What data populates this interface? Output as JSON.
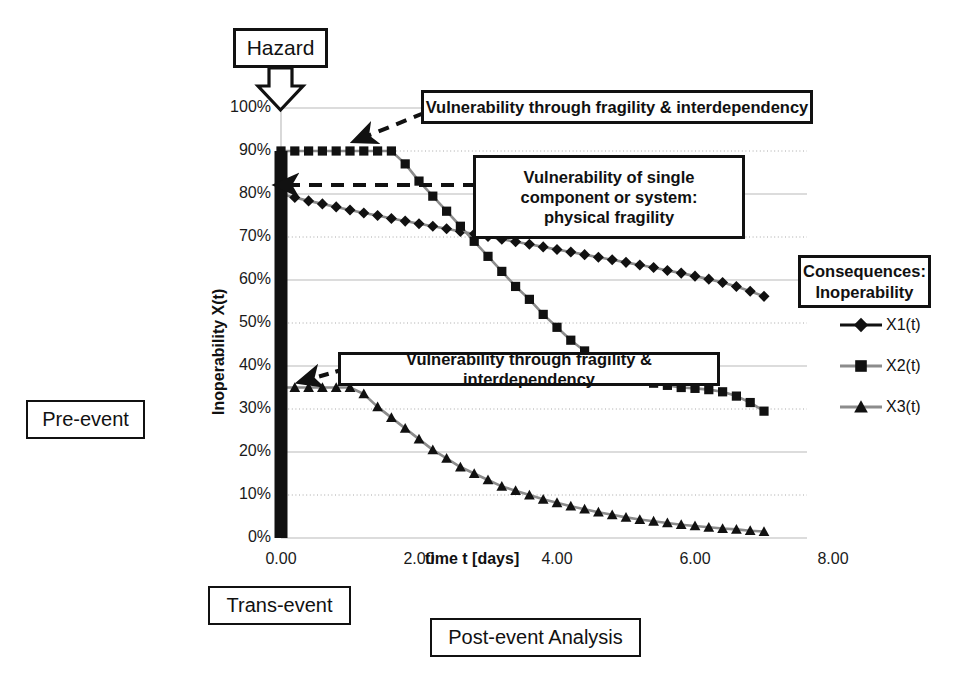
{
  "chart_data": {
    "type": "line",
    "title": "",
    "xlabel": "time t [days]",
    "ylabel": "Inoperability X(t)",
    "xlim": [
      0,
      8
    ],
    "ylim": [
      0,
      1
    ],
    "xticks": [
      "0.00",
      "2.00",
      "4.00",
      "6.00",
      "8.00"
    ],
    "xtick_values": [
      0,
      2,
      4,
      6,
      8
    ],
    "yticks": [
      "0%",
      "10%",
      "20%",
      "30%",
      "40%",
      "50%",
      "60%",
      "70%",
      "80%",
      "90%",
      "100%"
    ],
    "ytick_values": [
      0,
      10,
      20,
      30,
      40,
      50,
      60,
      70,
      80,
      90,
      100
    ],
    "grid": true,
    "legend_position": "right",
    "series": [
      {
        "name": "X1(t)",
        "marker": "diamond",
        "color": "#111111",
        "x": [
          0.0,
          0.2,
          0.4,
          0.6,
          0.8,
          1.0,
          1.2,
          1.4,
          1.6,
          1.8,
          2.0,
          2.2,
          2.4,
          2.6,
          2.8,
          3.0,
          3.2,
          3.4,
          3.6,
          3.8,
          4.0,
          4.2,
          4.4,
          4.6,
          4.8,
          5.0,
          5.2,
          5.4,
          5.6,
          5.8,
          6.0,
          6.2,
          6.4,
          6.6,
          6.8,
          7.0
        ],
        "values": [
          80.0,
          79.2,
          78.4,
          77.7,
          77.0,
          76.3,
          75.6,
          75.0,
          74.3,
          73.7,
          73.1,
          72.5,
          71.9,
          71.3,
          70.7,
          70.1,
          69.5,
          68.9,
          68.3,
          67.7,
          67.1,
          66.5,
          65.9,
          65.3,
          64.7,
          64.1,
          63.5,
          62.9,
          62.2,
          61.6,
          60.9,
          60.2,
          59.4,
          58.5,
          57.4,
          56.2
        ]
      },
      {
        "name": "X2(t)",
        "marker": "square",
        "color": "#111111",
        "x": [
          0.0,
          0.2,
          0.4,
          0.6,
          0.8,
          1.0,
          1.2,
          1.4,
          1.6,
          1.8,
          2.0,
          2.2,
          2.4,
          2.6,
          2.8,
          3.0,
          3.2,
          3.4,
          3.6,
          3.8,
          4.0,
          4.2,
          4.4,
          4.6,
          4.8,
          5.0,
          5.2,
          5.4,
          5.6,
          5.8,
          6.0,
          6.2,
          6.4,
          6.6,
          6.8,
          7.0
        ],
        "values": [
          90.0,
          90.0,
          90.0,
          90.0,
          90.0,
          90.0,
          90.0,
          90.0,
          90.0,
          87.0,
          83.0,
          79.5,
          76.0,
          72.5,
          69.0,
          65.5,
          62.0,
          58.5,
          55.5,
          52.0,
          49.0,
          46.0,
          43.5,
          41.0,
          39.0,
          37.5,
          36.5,
          36.0,
          35.5,
          35.0,
          34.8,
          34.5,
          34.0,
          33.0,
          31.5,
          29.5
        ]
      },
      {
        "name": "X3(t)",
        "marker": "triangle",
        "color": "#111111",
        "x": [
          0.0,
          0.2,
          0.4,
          0.6,
          0.8,
          1.0,
          1.2,
          1.4,
          1.6,
          1.8,
          2.0,
          2.2,
          2.4,
          2.6,
          2.8,
          3.0,
          3.2,
          3.4,
          3.6,
          3.8,
          4.0,
          4.2,
          4.4,
          4.6,
          4.8,
          5.0,
          5.2,
          5.4,
          5.6,
          5.8,
          6.0,
          6.2,
          6.4,
          6.6,
          6.8,
          7.0
        ],
        "values": [
          35.0,
          35.0,
          35.0,
          35.0,
          35.0,
          35.0,
          33.5,
          30.5,
          28.0,
          25.5,
          23.0,
          20.5,
          18.5,
          16.5,
          15.0,
          13.5,
          12.0,
          11.0,
          10.0,
          9.0,
          8.2,
          7.4,
          6.7,
          6.0,
          5.4,
          4.8,
          4.3,
          3.9,
          3.5,
          3.1,
          2.8,
          2.5,
          2.2,
          2.0,
          1.7,
          1.5
        ]
      }
    ],
    "hazard_bar": {
      "label": "hazard-impulse-bar",
      "x": 0.0,
      "y_top": 90,
      "y_bottom": 0
    }
  },
  "annotations": {
    "hazard": "Hazard",
    "pre_event": "Pre-event",
    "trans_event": "Trans-event",
    "post_event": "Post-event Analysis",
    "callout_top": "Vulnerability through fragility & interdependency",
    "callout_middle": "Vulnerability of single\ncomponent or system:\nphysical fragility",
    "callout_middle_line1": "Vulnerability of single",
    "callout_middle_line2": "component or system:",
    "callout_middle_line3": "physical fragility",
    "callout_lower": "Vulnerability through fragility & interdependency"
  },
  "legend": {
    "title_line1": "Consequences:",
    "title_line2": "Inoperability",
    "entries": [
      {
        "label": "X1(t)",
        "marker": "diamond"
      },
      {
        "label": "X2(t)",
        "marker": "square"
      },
      {
        "label": "X3(t)",
        "marker": "triangle"
      }
    ]
  },
  "colors": {
    "ink": "#111111",
    "grid_solid": "#b9b9b9",
    "grid_dotted": "#a8a8a8",
    "series_line_gray": "#8c8c8c",
    "background": "#ffffff"
  }
}
